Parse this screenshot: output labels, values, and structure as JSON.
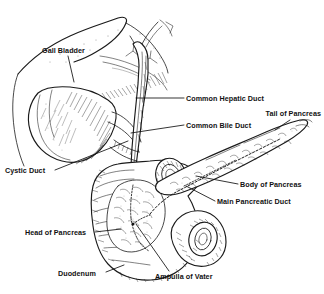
{
  "figure": {
    "background_color": "#ffffff",
    "ink_color": "#1a1a1a",
    "style": "black-and-white pen-and-ink anatomical line drawing with cross-hatching"
  },
  "labels": [
    {
      "id": "gall-bladder",
      "text": "Gall Bladder",
      "align": "left",
      "x": 42,
      "y": 53,
      "leader": "M 68 56 L 74 82"
    },
    {
      "id": "common-hepatic-duct",
      "text": "Common Hepatic Duct",
      "align": "left",
      "x": 186,
      "y": 101,
      "leader": "M 184 98 L 136 98"
    },
    {
      "id": "common-bile-duct",
      "text": "Common Bile Duct",
      "align": "left",
      "x": 186,
      "y": 128,
      "leader": "M 184 125 L 131 133"
    },
    {
      "id": "tail-of-pancreas",
      "text": "Tail of Pancreas",
      "align": "right",
      "x": 321,
      "y": 116,
      "leader": "M 290 120 L 275 130"
    },
    {
      "id": "cystic-duct",
      "text": "Cystic Duct",
      "align": "left",
      "x": 5,
      "y": 173,
      "leader": "M 55 170 L 128 141"
    },
    {
      "id": "body-of-pancreas",
      "text": "Body of Pancreas",
      "align": "left",
      "x": 240,
      "y": 187,
      "leader": "M 238 184 L 196 176"
    },
    {
      "id": "main-pancreatic-duct",
      "text": "Main Pancreatic Duct",
      "align": "left",
      "x": 217,
      "y": 204,
      "leader": "M 215 201 L 186 186"
    },
    {
      "id": "head-of-pancreas",
      "text": "Head of Pancreas",
      "align": "left",
      "x": 25,
      "y": 235,
      "leader": "M 95 232 L 121 229"
    },
    {
      "id": "duodenum",
      "text": "Duodenum",
      "align": "left",
      "x": 58,
      "y": 276,
      "leader": "M 106 272 L 124 265"
    },
    {
      "id": "ampulla-of-vater",
      "text": "Ampulla of Vater",
      "align": "left",
      "x": 155,
      "y": 279,
      "leader": "M 169 271 L 136 224"
    }
  ],
  "structures": [
    {
      "id": "liver",
      "name": "Liver (inferior surface)"
    },
    {
      "id": "gallbladder-body",
      "name": "Gallbladder"
    },
    {
      "id": "cystic-duct-tube",
      "name": "Cystic duct"
    },
    {
      "id": "hepatic-duct-tube",
      "name": "Common hepatic duct"
    },
    {
      "id": "bile-duct-tube",
      "name": "Common bile duct"
    },
    {
      "id": "duodenum-loop",
      "name": "Duodenum C-loop"
    },
    {
      "id": "duodenum-cut-upper",
      "name": "Duodenum upper cut end"
    },
    {
      "id": "duodenum-cut-lower",
      "name": "Duodenum lower cut end"
    },
    {
      "id": "pancreas-head",
      "name": "Head of pancreas"
    },
    {
      "id": "pancreas-body-tail",
      "name": "Body and tail of pancreas"
    },
    {
      "id": "pancreatic-duct-dashed",
      "name": "Main pancreatic duct (dashed)"
    },
    {
      "id": "bile-duct-hidden",
      "name": "Intrapancreatic bile duct (dotted)"
    },
    {
      "id": "ampulla",
      "name": "Ampulla of Vater"
    }
  ]
}
